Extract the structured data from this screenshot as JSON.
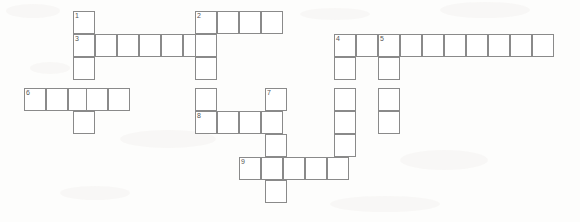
{
  "document": {
    "kind": "crossword-puzzle-grid",
    "title": "",
    "background_color": "#fdfdfc",
    "cell_fill_color": "#ffffff",
    "cell_border_color": "#8a8a8a",
    "number_color": "#555555"
  },
  "geometry": {
    "cell_width": 22,
    "cell_height": 23,
    "origin_x": 0,
    "origin_y": 0
  },
  "clue_numbers": [
    "1",
    "2",
    "3",
    "4",
    "5",
    "6",
    "7",
    "8",
    "9"
  ],
  "entries": [
    {
      "number": "1",
      "direction": "down",
      "length": 6,
      "start_x": 73,
      "start_y": 11
    },
    {
      "number": "2",
      "direction": "across",
      "length": 4,
      "start_x": 195,
      "start_y": 11
    },
    {
      "number": "2",
      "direction": "down",
      "length": 5,
      "start_x": 195,
      "start_y": 11
    },
    {
      "number": "3",
      "direction": "across",
      "length": 7,
      "start_x": 73,
      "start_y": 34
    },
    {
      "number": "4",
      "direction": "across",
      "length": 10,
      "start_x": 334,
      "start_y": 34
    },
    {
      "number": "4",
      "direction": "down",
      "length": 7,
      "start_x": 334,
      "start_y": 34
    },
    {
      "number": "5",
      "direction": "down",
      "length": 4,
      "start_x": 378,
      "start_y": 34
    },
    {
      "number": "6",
      "direction": "across",
      "length": 5,
      "start_x": 24,
      "start_y": 88
    },
    {
      "number": "7",
      "direction": "down",
      "length": 5,
      "start_x": 265,
      "start_y": 88
    },
    {
      "number": "8",
      "direction": "across",
      "length": 4,
      "start_x": 195,
      "start_y": 111
    },
    {
      "number": "9",
      "direction": "across",
      "length": 5,
      "start_x": 239,
      "start_y": 157
    }
  ],
  "cells": [
    {
      "name": "cell-r0-c3",
      "x": 73,
      "y": 11,
      "num": "1",
      "letter": ""
    },
    {
      "name": "cell-r0-c8",
      "x": 195,
      "y": 11,
      "num": "2",
      "letter": ""
    },
    {
      "name": "cell-r0-c9",
      "x": 217,
      "y": 11,
      "num": "",
      "letter": ""
    },
    {
      "name": "cell-r0-c10",
      "x": 239,
      "y": 11,
      "num": "",
      "letter": ""
    },
    {
      "name": "cell-r0-c11",
      "x": 261,
      "y": 11,
      "num": "",
      "letter": ""
    },
    {
      "name": "cell-r1-c3",
      "x": 73,
      "y": 34,
      "num": "3",
      "letter": ""
    },
    {
      "name": "cell-r1-c4",
      "x": 95,
      "y": 34,
      "num": "",
      "letter": ""
    },
    {
      "name": "cell-r1-c5",
      "x": 117,
      "y": 34,
      "num": "",
      "letter": ""
    },
    {
      "name": "cell-r1-c6",
      "x": 139,
      "y": 34,
      "num": "",
      "letter": ""
    },
    {
      "name": "cell-r1-c7",
      "x": 161,
      "y": 34,
      "num": "",
      "letter": ""
    },
    {
      "name": "cell-r1-c8",
      "x": 183,
      "y": 34,
      "num": "",
      "letter": ""
    },
    {
      "name": "cell-r1-c9",
      "x": 195,
      "y": 34,
      "num": "",
      "letter": ""
    },
    {
      "name": "cell-r1-c20",
      "x": 334,
      "y": 34,
      "num": "4",
      "letter": ""
    },
    {
      "name": "cell-r1-c21",
      "x": 356,
      "y": 34,
      "num": "",
      "letter": ""
    },
    {
      "name": "cell-r1-c22",
      "x": 378,
      "y": 34,
      "num": "5",
      "letter": ""
    },
    {
      "name": "cell-r1-c23",
      "x": 400,
      "y": 34,
      "num": "",
      "letter": ""
    },
    {
      "name": "cell-r1-c24",
      "x": 422,
      "y": 34,
      "num": "",
      "letter": ""
    },
    {
      "name": "cell-r1-c25",
      "x": 444,
      "y": 34,
      "num": "",
      "letter": ""
    },
    {
      "name": "cell-r1-c26",
      "x": 466,
      "y": 34,
      "num": "",
      "letter": ""
    },
    {
      "name": "cell-r1-c27",
      "x": 488,
      "y": 34,
      "num": "",
      "letter": ""
    },
    {
      "name": "cell-r1-c28",
      "x": 510,
      "y": 34,
      "num": "",
      "letter": ""
    },
    {
      "name": "cell-r1-c29",
      "x": 532,
      "y": 34,
      "num": "",
      "letter": ""
    },
    {
      "name": "cell-r2-c3",
      "x": 73,
      "y": 57,
      "num": "",
      "letter": ""
    },
    {
      "name": "cell-r2-c8",
      "x": 195,
      "y": 57,
      "num": "",
      "letter": ""
    },
    {
      "name": "cell-r2-c20",
      "x": 334,
      "y": 57,
      "num": "",
      "letter": ""
    },
    {
      "name": "cell-r2-c22",
      "x": 378,
      "y": 57,
      "num": "",
      "letter": ""
    },
    {
      "name": "cell-r3-c0",
      "x": 24,
      "y": 88,
      "num": "6",
      "letter": ""
    },
    {
      "name": "cell-r3-c1",
      "x": 46,
      "y": 88,
      "num": "",
      "letter": ""
    },
    {
      "name": "cell-r3-c2",
      "x": 68,
      "y": 88,
      "num": "",
      "letter": ""
    },
    {
      "name": "cell-r3-c3",
      "x": 86,
      "y": 88,
      "num": "",
      "letter": ""
    },
    {
      "name": "cell-r3-c4",
      "x": 108,
      "y": 88,
      "num": "",
      "letter": ""
    },
    {
      "name": "cell-r3-c8",
      "x": 195,
      "y": 88,
      "num": "",
      "letter": ""
    },
    {
      "name": "cell-r3-c12",
      "x": 265,
      "y": 88,
      "num": "7",
      "letter": ""
    },
    {
      "name": "cell-r3-c20",
      "x": 334,
      "y": 88,
      "num": "",
      "letter": ""
    },
    {
      "name": "cell-r3-c22",
      "x": 378,
      "y": 88,
      "num": "",
      "letter": ""
    },
    {
      "name": "cell-r4-c3",
      "x": 73,
      "y": 111,
      "num": "",
      "letter": ""
    },
    {
      "name": "cell-r4-c8",
      "x": 195,
      "y": 111,
      "num": "8",
      "letter": ""
    },
    {
      "name": "cell-r4-c9",
      "x": 217,
      "y": 111,
      "num": "",
      "letter": ""
    },
    {
      "name": "cell-r4-c10",
      "x": 239,
      "y": 111,
      "num": "",
      "letter": ""
    },
    {
      "name": "cell-r4-c11",
      "x": 261,
      "y": 111,
      "num": "",
      "letter": ""
    },
    {
      "name": "cell-r4-c20",
      "x": 334,
      "y": 111,
      "num": "",
      "letter": ""
    },
    {
      "name": "cell-r4-c22",
      "x": 378,
      "y": 111,
      "num": "",
      "letter": ""
    },
    {
      "name": "cell-r5-c12",
      "x": 265,
      "y": 134,
      "num": "",
      "letter": ""
    },
    {
      "name": "cell-r5-c20",
      "x": 334,
      "y": 134,
      "num": "",
      "letter": ""
    },
    {
      "name": "cell-r6-c10",
      "x": 239,
      "y": 157,
      "num": "9",
      "letter": ""
    },
    {
      "name": "cell-r6-c11",
      "x": 261,
      "y": 157,
      "num": "",
      "letter": ""
    },
    {
      "name": "cell-r6-c12",
      "x": 283,
      "y": 157,
      "num": "",
      "letter": ""
    },
    {
      "name": "cell-r6-c13",
      "x": 305,
      "y": 157,
      "num": "",
      "letter": ""
    },
    {
      "name": "cell-r6-c14",
      "x": 327,
      "y": 157,
      "num": "",
      "letter": ""
    },
    {
      "name": "cell-r7-c12",
      "x": 265,
      "y": 180,
      "num": "",
      "letter": ""
    }
  ]
}
